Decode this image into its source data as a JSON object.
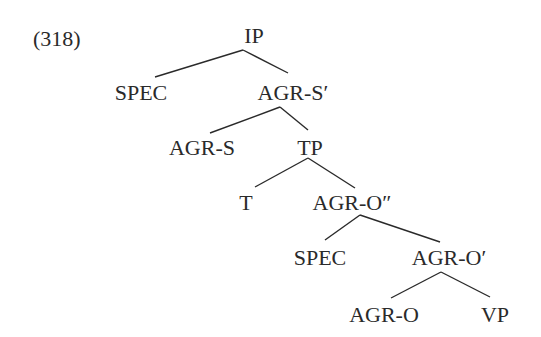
{
  "example_number": "(318)",
  "tree": {
    "nodes": [
      {
        "id": "ip",
        "label": "IP",
        "x": 254,
        "y": 43
      },
      {
        "id": "spec1",
        "label": "SPEC",
        "x": 141,
        "y": 100
      },
      {
        "id": "agr-s-bar",
        "label": "AGR-S′",
        "x": 293,
        "y": 100
      },
      {
        "id": "agr-s",
        "label": "AGR-S",
        "x": 202,
        "y": 155
      },
      {
        "id": "tp",
        "label": "TP",
        "x": 310,
        "y": 155
      },
      {
        "id": "t",
        "label": "T",
        "x": 246,
        "y": 210
      },
      {
        "id": "agr-o-dbar",
        "label": "AGR-O″",
        "x": 352,
        "y": 210
      },
      {
        "id": "spec2",
        "label": "SPEC",
        "x": 320,
        "y": 265
      },
      {
        "id": "agr-o-bar",
        "label": "AGR-O′",
        "x": 449,
        "y": 265
      },
      {
        "id": "agr-o",
        "label": "AGR-O",
        "x": 384,
        "y": 322
      },
      {
        "id": "vp",
        "label": "VP",
        "x": 495,
        "y": 322
      }
    ],
    "edges": [
      {
        "from": "ip",
        "to": "spec1",
        "x1": 243,
        "y1": 50,
        "x2": 155,
        "y2": 77
      },
      {
        "from": "ip",
        "to": "agr-s-bar",
        "x1": 243,
        "y1": 50,
        "x2": 288,
        "y2": 73
      },
      {
        "from": "agr-s-bar",
        "to": "agr-s",
        "x1": 280,
        "y1": 107,
        "x2": 210,
        "y2": 133
      },
      {
        "from": "agr-s-bar",
        "to": "tp",
        "x1": 280,
        "y1": 107,
        "x2": 308,
        "y2": 130
      },
      {
        "from": "tp",
        "to": "t",
        "x1": 308,
        "y1": 158,
        "x2": 255,
        "y2": 187
      },
      {
        "from": "tp",
        "to": "agr-o-dbar",
        "x1": 308,
        "y1": 158,
        "x2": 355,
        "y2": 188
      },
      {
        "from": "agr-o-dbar",
        "to": "spec2",
        "x1": 360,
        "y1": 215,
        "x2": 325,
        "y2": 240
      },
      {
        "from": "agr-o-dbar",
        "to": "agr-o-bar",
        "x1": 360,
        "y1": 215,
        "x2": 440,
        "y2": 242
      },
      {
        "from": "agr-o-bar",
        "to": "agr-o",
        "x1": 441,
        "y1": 272,
        "x2": 391,
        "y2": 298
      },
      {
        "from": "agr-o-bar",
        "to": "vp",
        "x1": 441,
        "y1": 272,
        "x2": 490,
        "y2": 297
      }
    ]
  }
}
